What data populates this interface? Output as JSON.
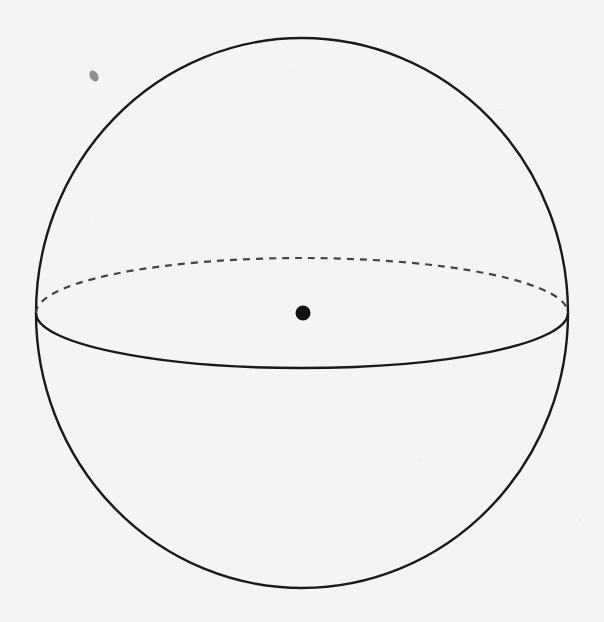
{
  "figure": {
    "type": "sphere",
    "description": "Sphere with dashed hidden equator and marked center point",
    "colors": {
      "background": "#f4f4f3",
      "outline": "#1a1a1a",
      "dashed": "#444444",
      "center_dot": "#111111",
      "smudge": "#8a8a8a"
    },
    "sphere": {
      "cx": 302,
      "cy": 313,
      "rx": 266,
      "ry": 275
    },
    "equator": {
      "cx": 302,
      "cy": 313,
      "rx": 266,
      "ry": 55
    },
    "center": {
      "x": 303,
      "y": 313,
      "r": 8
    },
    "smudge": {
      "x": 93,
      "y": 75
    }
  }
}
